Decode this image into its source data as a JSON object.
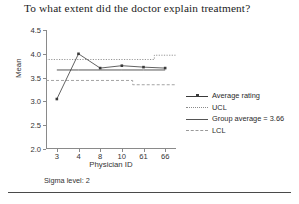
{
  "title": "To what extent did the doctor explain treatment?",
  "axis": {
    "y_title": "Mean",
    "x_title": "Physician ID",
    "y_ticks": [
      "4.5",
      "4.0",
      "3.5",
      "3.0",
      "2.5",
      "2.0"
    ],
    "x_ticks": [
      "3",
      "4",
      "8",
      "10",
      "61",
      "66"
    ]
  },
  "footnote": "Sigma level: 2",
  "legend": {
    "items": [
      {
        "label": "Average rating",
        "style": "line-marker",
        "color": "#3a3a3a"
      },
      {
        "label": "UCL",
        "style": "dotted",
        "color": "#8a8a8a"
      },
      {
        "label": "Group average = 3.66",
        "style": "solid",
        "color": "#555555"
      },
      {
        "label": "LCL",
        "style": "dashed",
        "color": "#9a9a9a"
      }
    ]
  },
  "colors": {
    "series": "#3a3a3a",
    "ucl": "#8a8a8a",
    "lcl": "#9a9a9a",
    "center": "#555555",
    "axis": "#8a8a8a"
  },
  "chart_data": {
    "type": "line",
    "title": "To what extent did the doctor explain treatment?",
    "xlabel": "Physician ID",
    "ylabel": "Mean",
    "categories": [
      "3",
      "4",
      "8",
      "10",
      "61",
      "66"
    ],
    "ylim": [
      2.0,
      4.5
    ],
    "ytick_step": 0.5,
    "grid": false,
    "legend_position": "right",
    "sigma_level": 2,
    "group_average": 3.66,
    "series": [
      {
        "name": "Average rating",
        "values": [
          3.05,
          4.0,
          3.7,
          3.75,
          3.72,
          3.7
        ]
      },
      {
        "name": "UCL",
        "values": [
          3.88,
          3.88,
          3.88,
          3.88,
          3.88,
          3.97
        ]
      },
      {
        "name": "Group average = 3.66",
        "values": [
          3.66,
          3.66,
          3.66,
          3.66,
          3.66,
          3.66
        ]
      },
      {
        "name": "LCL",
        "values": [
          3.44,
          3.44,
          3.44,
          3.44,
          3.35,
          3.35
        ]
      }
    ],
    "annotations": [
      "Sigma level: 2"
    ]
  }
}
